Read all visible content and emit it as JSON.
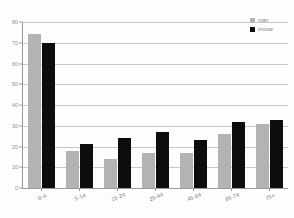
{
  "chart_data": {
    "type": "bar",
    "title": "",
    "subtitle": "",
    "xlabel": "",
    "ylabel": "",
    "categories": [
      "0-4",
      "5-14",
      "15-24",
      "25-44",
      "45-64",
      "65-74",
      "75+"
    ],
    "series": [
      {
        "name": "man",
        "color": "#b3b3b3",
        "values": [
          74,
          18,
          14,
          17,
          17,
          26,
          31
        ]
      },
      {
        "name": "vrouw",
        "color": "#0d0d0d",
        "values": [
          70,
          21,
          24,
          27,
          23,
          32,
          33
        ]
      }
    ],
    "ylim": [
      0,
      80
    ],
    "yticks": [
      0,
      10,
      20,
      30,
      40,
      50,
      60,
      70,
      80
    ],
    "ytick_labels": [
      "0",
      "10",
      "20",
      "30",
      "40",
      "50",
      "60",
      "70",
      "80"
    ],
    "grid": true,
    "grid_axis": "y",
    "legend_position": "top-right",
    "orientation": "vertical",
    "grouping": "clustered"
  },
  "colors": {
    "series_man": "#b3b3b3",
    "series_vrouw": "#0d0d0d",
    "gridline": "#c8c8c8",
    "axis": "#9a9a9a",
    "tick_text": "#8d8d8d",
    "background": "#fdfdfd"
  },
  "legend": {
    "items": [
      {
        "label": "man"
      },
      {
        "label": "vrouw"
      }
    ]
  }
}
